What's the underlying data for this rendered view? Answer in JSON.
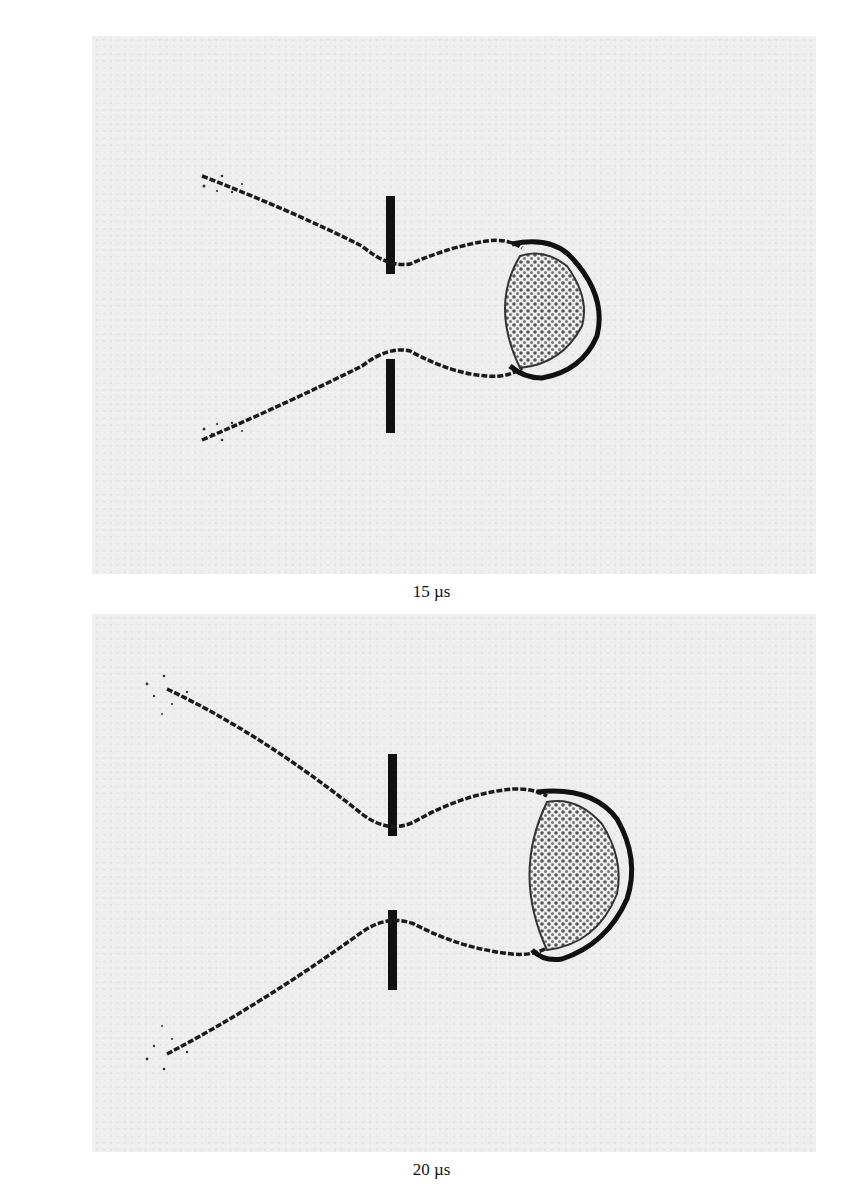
{
  "figure": {
    "panels": [
      {
        "caption": "15 µs",
        "time_us": 15
      },
      {
        "caption": "20 µs",
        "time_us": 20
      }
    ],
    "colors": {
      "background": "#eeeeee",
      "ink": "#111111",
      "particle_fill": "#555555"
    }
  }
}
